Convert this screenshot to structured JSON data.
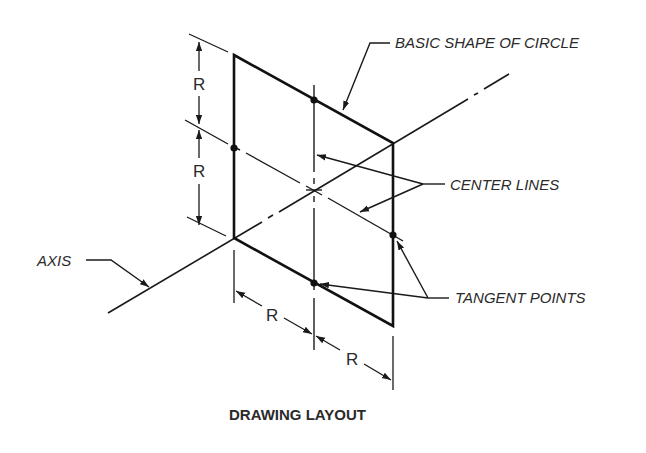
{
  "caption": "DRAWING LAYOUT",
  "labels": {
    "basic_shape": "BASIC SHAPE OF CIRCLE",
    "center_lines": "CENTER LINES",
    "tangent_points": "TANGENT POINTS",
    "axis": "AXIS"
  },
  "dimensions": {
    "left_upper": "R",
    "left_lower": "R",
    "bottom_left": "R",
    "bottom_right": "R"
  },
  "colors": {
    "line": "#1a1a1a",
    "text": "#2a2a2a",
    "background": "#ffffff"
  }
}
